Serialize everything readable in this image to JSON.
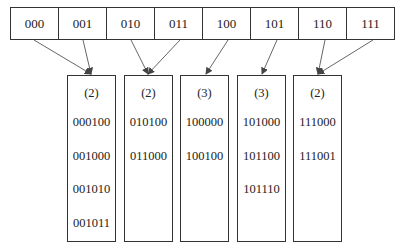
{
  "directory": {
    "cells": [
      "000",
      "001",
      "010",
      "011",
      "100",
      "101",
      "110",
      "111"
    ]
  },
  "buckets": [
    {
      "depth": "(2)",
      "keys": [
        "000100",
        "001000",
        "001010",
        "001011"
      ]
    },
    {
      "depth": "(2)",
      "keys": [
        "010100",
        "011000"
      ]
    },
    {
      "depth": "(3)",
      "keys": [
        "100000",
        "100100"
      ]
    },
    {
      "depth": "(3)",
      "keys": [
        "101000",
        "101100",
        "101110"
      ]
    },
    {
      "depth": "(2)",
      "keys": [
        "111000",
        "111001"
      ]
    }
  ],
  "pointers": [
    {
      "from": "000",
      "to": 0
    },
    {
      "from": "001",
      "to": 0
    },
    {
      "from": "010",
      "to": 1
    },
    {
      "from": "011",
      "to": 1
    },
    {
      "from": "100",
      "to": 2
    },
    {
      "from": "101",
      "to": 3
    },
    {
      "from": "110",
      "to": 4
    },
    {
      "from": "111",
      "to": 4
    }
  ]
}
